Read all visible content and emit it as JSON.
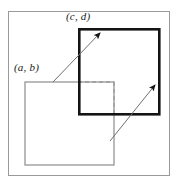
{
  "figure": {
    "background_color": "#ffffff",
    "frame": {
      "name": "outer-frame",
      "x": 8,
      "y": 11,
      "width": 162,
      "height": 165,
      "stroke": "#9a9a9a",
      "stroke_width": 1
    },
    "rectangles": [
      {
        "id": "rect-ab",
        "label": "(a, b)",
        "x": 25,
        "y": 82,
        "width": 89,
        "height": 83,
        "stroke": "#8c8c8c",
        "stroke_width": 1.2,
        "style": "solid",
        "fill": "none"
      },
      {
        "id": "rect-cd",
        "label": "(c, d)",
        "x": 78,
        "y": 28,
        "width": 82,
        "height": 87,
        "stroke": "#141414",
        "stroke_width": 2.6,
        "style": "solid",
        "fill": "none"
      },
      {
        "id": "rect-intersection",
        "label": "",
        "x": 78,
        "y": 82,
        "width": 36,
        "height": 33,
        "stroke": "#9a9a9a",
        "stroke_width": 1.2,
        "style": "dashed",
        "fill": "none"
      }
    ],
    "arrows": [
      {
        "id": "arrow-lower-left-to-upper-right",
        "x1": 53,
        "y1": 82,
        "x2": 102,
        "y2": 31,
        "stroke": "#6f6f6f",
        "stroke_width": 1,
        "head_color": "#141414"
      },
      {
        "id": "arrow-bottom-to-right",
        "x1": 110,
        "y1": 141,
        "x2": 157,
        "y2": 83,
        "stroke": "#6f6f6f",
        "stroke_width": 1,
        "head_color": "#141414"
      }
    ],
    "labels": [
      {
        "id": "label-cd",
        "text": "(c, d)",
        "x": 66,
        "y": 20,
        "anchor": "start"
      },
      {
        "id": "label-ab",
        "text": "(a, b)",
        "x": 14,
        "y": 71,
        "anchor": "start"
      }
    ]
  }
}
